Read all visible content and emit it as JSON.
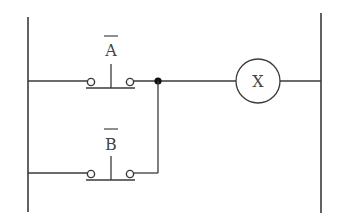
{
  "diagram": {
    "type": "ladder-logic",
    "rungs": [
      {
        "contact": {
          "label": "A",
          "negated": true,
          "type": "normally-closed-pushbutton"
        },
        "output": {
          "label": "X",
          "type": "coil"
        }
      },
      {
        "contact": {
          "label": "B",
          "negated": true,
          "type": "normally-closed-pushbutton"
        },
        "parallel_with": "A"
      }
    ],
    "colors": {
      "line": "#3a3a3a",
      "junction": "#111111",
      "background": "#ffffff"
    }
  }
}
